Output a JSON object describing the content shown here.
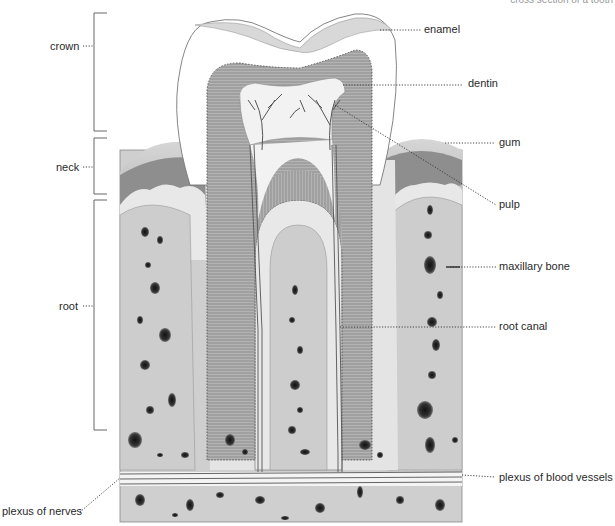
{
  "title": "cross section of a tooth",
  "colors": {
    "background": "#ffffff",
    "enamel": "#ffffff",
    "dentin": "#a9a9a9",
    "pulp": "#f4f4f4",
    "gum_outer": "#c9c9c9",
    "gum_dark": "#8c8c8c",
    "bone": "#cdcdcd",
    "cementum": "#e6e6e6",
    "vessels": "#555555",
    "leader_line": "#333333"
  },
  "left_labels": [
    {
      "id": "crown",
      "text": "crown"
    },
    {
      "id": "neck",
      "text": "neck"
    },
    {
      "id": "root",
      "text": "root"
    },
    {
      "id": "plexus_nerves",
      "text": "plexus of nerves"
    }
  ],
  "right_labels": [
    {
      "id": "enamel",
      "text": "enamel"
    },
    {
      "id": "dentin",
      "text": "dentin"
    },
    {
      "id": "gum",
      "text": "gum"
    },
    {
      "id": "pulp",
      "text": "pulp"
    },
    {
      "id": "maxillary_bone",
      "text": "maxillary bone"
    },
    {
      "id": "root_canal",
      "text": "root canal"
    },
    {
      "id": "plexus_blood_vessels",
      "text": "plexus of blood vessels"
    }
  ]
}
